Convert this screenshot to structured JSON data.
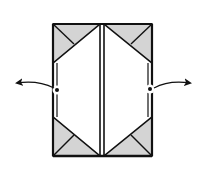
{
  "diagram": {
    "type": "origami-step",
    "colors": {
      "background": "#ffffff",
      "stroke": "#111111",
      "fill_folded": "#d4d4d4",
      "fill_paper": "#ffffff"
    },
    "outer_rect": {
      "x": 53,
      "y": 24,
      "width": 100,
      "height": 133
    },
    "center_divider": {
      "x1": 100,
      "x2": 104
    },
    "panels": [
      {
        "id": "left-panel",
        "outline": [
          [
            53,
            24
          ],
          [
            100,
            24
          ],
          [
            100,
            156
          ],
          [
            53,
            156
          ]
        ],
        "top_triangle": [
          [
            53,
            24
          ],
          [
            100,
            24
          ],
          [
            53,
            63
          ]
        ],
        "top_inner_crease": [
          [
            53,
            24
          ],
          [
            74,
            44
          ]
        ],
        "bottom_triangle": [
          [
            53,
            117
          ],
          [
            53,
            156
          ],
          [
            100,
            156
          ]
        ],
        "bottom_inner_crease": [
          [
            53,
            156
          ],
          [
            74,
            135
          ]
        ],
        "pull_point": [
          57,
          90
        ]
      },
      {
        "id": "right-panel",
        "outline": [
          [
            104,
            24
          ],
          [
            152,
            24
          ],
          [
            152,
            156
          ],
          [
            104,
            156
          ]
        ],
        "top_triangle": [
          [
            104,
            24
          ],
          [
            152,
            24
          ],
          [
            152,
            63
          ]
        ],
        "top_inner_crease": [
          [
            152,
            24
          ],
          [
            131,
            44
          ]
        ],
        "bottom_triangle": [
          [
            152,
            117
          ],
          [
            152,
            156
          ],
          [
            104,
            156
          ]
        ],
        "bottom_inner_crease": [
          [
            152,
            156
          ],
          [
            131,
            135
          ]
        ],
        "pull_point": [
          150,
          89
        ]
      }
    ],
    "arrows": [
      {
        "id": "left-arrow",
        "direction": "left",
        "from": [
          55,
          89
        ],
        "to": [
          15,
          83
        ]
      },
      {
        "id": "right-arrow",
        "direction": "right",
        "from": [
          153,
          89
        ],
        "to": [
          193,
          83
        ]
      }
    ]
  }
}
